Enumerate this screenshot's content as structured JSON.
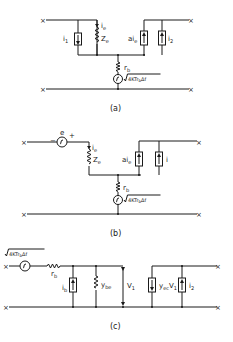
{
  "figure": {
    "a": {
      "caption": "(a)",
      "labels": {
        "i1": "i",
        "i1_sub": "1",
        "ie": "i",
        "ie_sub": "e",
        "ze": "Z",
        "ze_sub": "e",
        "aie": "ai",
        "aie_sub": "e",
        "i2": "i",
        "i2_sub": "2",
        "rb": "r",
        "rb_sub": "b",
        "noise": "4KTr",
        "noise_sub": "b",
        "noise_tail": "Δf"
      }
    },
    "b": {
      "caption": "(b)",
      "labels": {
        "e": "e",
        "minus": "−",
        "plus": "+",
        "ie": "i",
        "ie_sub": "e",
        "ze": "Z",
        "ze_sub": "e",
        "aie": "ai",
        "aie_sub": "e",
        "i": "i",
        "rb": "r",
        "rb_sub": "b",
        "noise": "4KTr",
        "noise_sub": "b",
        "noise_tail": "Δf"
      }
    },
    "c": {
      "caption": "(c)",
      "labels": {
        "noise": "4KTr",
        "noise_sub": "b",
        "noise_tail": "Δf",
        "rb": "r",
        "rb_sub": "b",
        "ib": "i",
        "ib_sub": "b",
        "ybe": "y",
        "ybe_sub": "be",
        "v1": "V",
        "v1_sub": "1",
        "yec": "y",
        "yec_sub": "ec",
        "yec_tail": "V",
        "yec_tail_sub": "1",
        "i2": "i",
        "i2_sub": "2"
      }
    },
    "terminal_symbol": "×"
  }
}
